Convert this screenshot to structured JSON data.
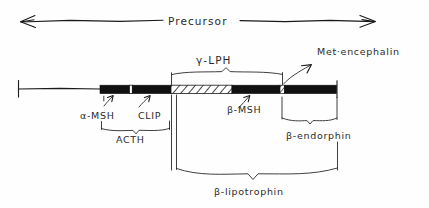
{
  "diagram": {
    "title_label": "Precursor",
    "segments": {
      "alpha_msh": "α-MSH",
      "clip": "CLIP",
      "acth": "ACTH",
      "gamma_lph": "γ-LPH",
      "beta_msh": "β-MSH",
      "met_enkephalin": "Met·encephalin",
      "beta_endorphin": "β-endorphin",
      "beta_lipotrophin": "β-lipotrophin"
    },
    "colors": {
      "ink": "#1a1a1a",
      "fill_black": "#111111",
      "fill_white": "#fefefe",
      "background": "#ffffff"
    }
  }
}
